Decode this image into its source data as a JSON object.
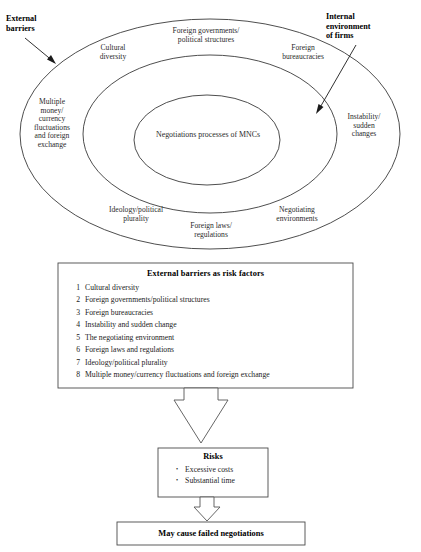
{
  "callouts": {
    "external_barriers": "External\nbarriers",
    "internal_environment": "Internal\nenvironment\nof firms"
  },
  "rings": {
    "core": "Negotiations processes of MNCs",
    "labels": {
      "cultural_diversity": "Cultural\ndiversity",
      "foreign_governments": "Foreign governments/\npolitical structures",
      "foreign_bureaucracies": "Foreign\nbureaucracies",
      "multiple_money": "Multiple\nmoney/\ncurrency\nfluctuations\nand foreign\nexchange",
      "instability": "Instability/\nsudden\nchanges",
      "ideology": "Ideology/political\nplurality",
      "foreign_laws": "Foreign laws/\nregulations",
      "negotiating_environments": "Negotiating\nenvironments"
    }
  },
  "risk_factors_box": {
    "title": "External barriers as risk factors",
    "items": [
      {
        "number": "1",
        "text": "Cultural diversity"
      },
      {
        "number": "2",
        "text": "Foreign governments/political structures"
      },
      {
        "number": "3",
        "text": "Foreign bureaucracies"
      },
      {
        "number": "4",
        "text": "Instability and sudden change"
      },
      {
        "number": "5",
        "text": "The negotiating environment"
      },
      {
        "number": "6",
        "text": "Foreign laws and regulations"
      },
      {
        "number": "7",
        "text": "Ideology/political plurality"
      },
      {
        "number": "8",
        "text": "Multiple money/currency fluctuations and foreign exchange"
      }
    ]
  },
  "risks_box": {
    "title": "Risks",
    "items": [
      {
        "bullet": "•",
        "text": "Excessive costs"
      },
      {
        "bullet": "•",
        "text": "Substantial time"
      }
    ]
  },
  "outcome_box": {
    "text": "May cause failed negotiations"
  },
  "colors": {
    "stroke": "#3a3a3a",
    "text": "#232323",
    "background": "#ffffff"
  }
}
